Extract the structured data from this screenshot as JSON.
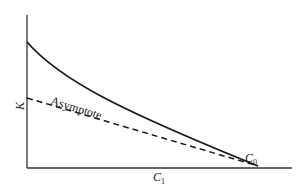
{
  "diagram": {
    "y_axis_label": "K",
    "x_axis_label": "C",
    "x_axis_label_sub": "1",
    "endpoint_label": "C",
    "endpoint_label_sub": "0",
    "asymptote_label": "Asymptote",
    "colors": {
      "ink": "#222222",
      "background": "#ffffff"
    }
  }
}
